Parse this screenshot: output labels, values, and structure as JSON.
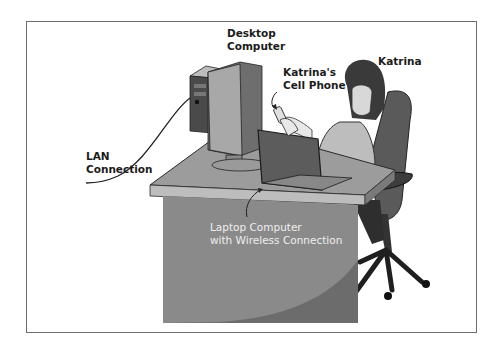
{
  "figure": {
    "labels": {
      "desktop_computer": [
        "Desktop",
        "Computer"
      ],
      "cell_phone": [
        "Katrina's",
        "Cell Phone"
      ],
      "katrina": "Katrina",
      "lan_connection": [
        "LAN",
        "Connection"
      ],
      "laptop": [
        "Laptop Computer",
        "with Wireless Connection"
      ]
    },
    "colors": {
      "frame_border": "#6e6e6e",
      "desk_top": "#9c9c9c",
      "desk_front": "#8a8a8a",
      "desk_shadow": "#6c6c6c",
      "chair": "#5a5a5a",
      "hair": "#3a3a3a"
    }
  }
}
